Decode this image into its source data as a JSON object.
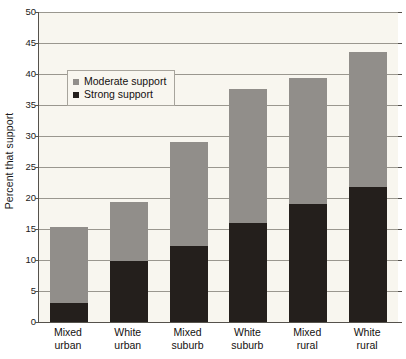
{
  "chart_data": {
    "type": "bar",
    "stacked": true,
    "title": "",
    "xlabel": "",
    "ylabel": "Percent that support",
    "ylim": [
      0,
      50
    ],
    "ytick_step": 5,
    "yticks": [
      0,
      5,
      10,
      15,
      20,
      25,
      30,
      35,
      40,
      45,
      50
    ],
    "ytick_labels": [
      "0",
      "5",
      "10",
      "15",
      "20",
      "25",
      "30",
      "35",
      "40",
      "45",
      "50"
    ],
    "grid": true,
    "legend_position": "upper-left-inside",
    "categories": [
      "Mixed urban",
      "White urban",
      "Mixed suburb",
      "White suburb",
      "Mixed rural",
      "White rural"
    ],
    "category_lines": [
      [
        "Mixed",
        "urban"
      ],
      [
        "White",
        "urban"
      ],
      [
        "Mixed",
        "suburb"
      ],
      [
        "White",
        "suburb"
      ],
      [
        "Mixed",
        "rural"
      ],
      [
        "White",
        "rural"
      ]
    ],
    "series": [
      {
        "name": "Strong support",
        "color": "#241f1c",
        "values": [
          3.0,
          9.8,
          12.3,
          16.0,
          19.0,
          21.8
        ]
      },
      {
        "name": "Moderate support",
        "color": "#918e8a",
        "values": [
          12.3,
          9.6,
          16.7,
          21.6,
          20.3,
          21.7
        ]
      }
    ],
    "totals": [
      15.3,
      19.4,
      29.0,
      37.6,
      39.3,
      43.5
    ],
    "legend": [
      {
        "label": "Moderate support",
        "color": "#918e8a",
        "marker": "square"
      },
      {
        "label": "Strong support",
        "color": "#241f1c",
        "marker": "square"
      }
    ]
  },
  "colors": {
    "plot_background": "#f8f6ef",
    "page_background": "#ffffff",
    "gridline": "#9a978f",
    "axis": "#55524c",
    "text": "#14110f",
    "moderate_support": "#918e8a",
    "strong_support": "#241f1c"
  }
}
